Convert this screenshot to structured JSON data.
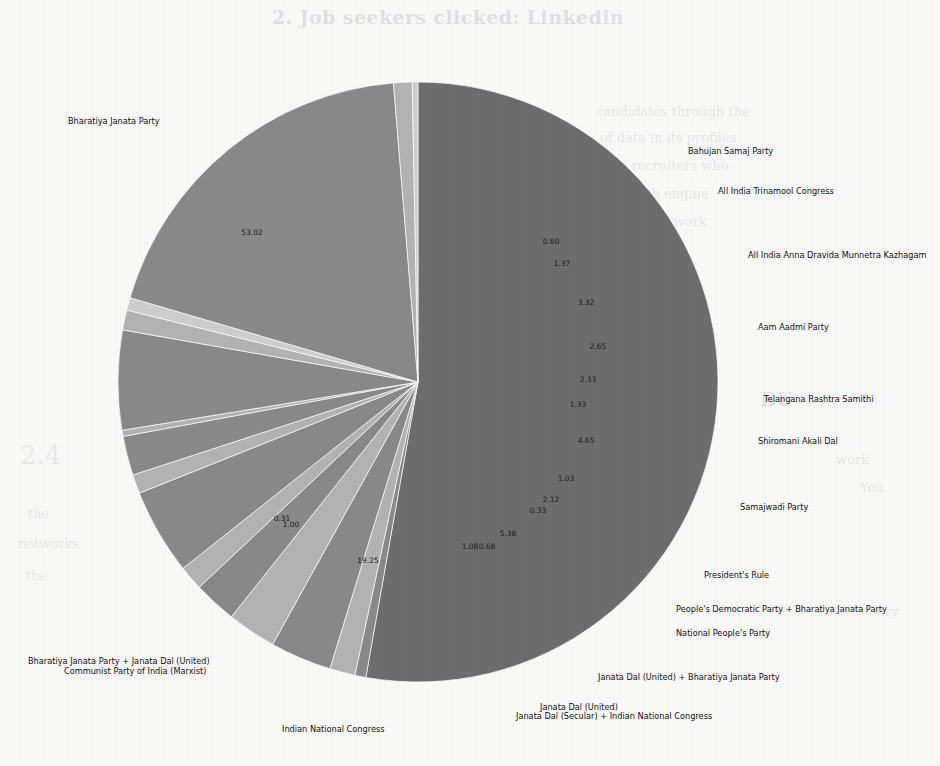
{
  "page": {
    "background_color": "#fbfbfa",
    "bleed_through_texts": [
      {
        "text": "2. Job seekers clicked: Linkedin",
        "x": 272,
        "y": 6,
        "style": "heading"
      },
      {
        "text": "candidates through the",
        "x": 596,
        "y": 104,
        "style": "body"
      },
      {
        "text": "of data in its profiles",
        "x": 600,
        "y": 130,
        "style": "body"
      },
      {
        "text": "the recruiters who",
        "x": 606,
        "y": 158,
        "style": "body"
      },
      {
        "text": "a search engine",
        "x": 604,
        "y": 186,
        "style": "body"
      },
      {
        "text": "of the network",
        "x": 610,
        "y": 214,
        "style": "body"
      },
      {
        "text": "BU",
        "x": 760,
        "y": 388,
        "style": "heading"
      },
      {
        "text": "2.4",
        "x": 20,
        "y": 440,
        "style": "big"
      },
      {
        "text": "work",
        "x": 836,
        "y": 452,
        "style": "body"
      },
      {
        "text": "You",
        "x": 860,
        "y": 480,
        "style": "body"
      },
      {
        "text": "the",
        "x": 28,
        "y": 506,
        "style": "body"
      },
      {
        "text": "networks",
        "x": 18,
        "y": 536,
        "style": "body"
      },
      {
        "text": "the",
        "x": 26,
        "y": 568,
        "style": "body"
      },
      {
        "text": "try",
        "x": 880,
        "y": 604,
        "style": "body"
      },
      {
        "text": "GETS",
        "x": 560,
        "y": 490,
        "style": "big"
      },
      {
        "text": "unlikely",
        "x": 380,
        "y": 520,
        "style": "big"
      }
    ]
  },
  "chart_data": {
    "type": "pie",
    "title": "",
    "units": "percent",
    "label_format": "two-decimal percentage",
    "start_angle_deg": 90,
    "direction": "clockwise",
    "center": {
      "x": 418,
      "y": 382
    },
    "radius": 300,
    "colors": {
      "dark": "#6e6e6e",
      "mid": "#8a8a8a",
      "light": "#b4b4b4",
      "pale": "#cfcfcf"
    },
    "categories": [
      "Bharatiya Janata Party",
      "Bahujan Samaj Party",
      "All India Trinamool Congress",
      "All India Anna Dravida Munnetra Kazhagam",
      "Aam Aadmi Party",
      "Telangana Rashtra Samithi",
      "Shiromani Akali Dal",
      "Samajwadi Party",
      "President's Rule",
      "People's Democratic Party + Bharatiya Janata Party",
      "National People's Party",
      "Janata Dal (United) + Bharatiya Janata Party",
      "Janata Dal (United)",
      "Janata Dal (Secular) + Indian National Congress",
      "Indian National Congress",
      "Communist Party of India (Marxist)",
      "Bharatiya Janata Party + Janata Dal (United)"
    ],
    "values": [
      53.02,
      0.6,
      1.37,
      3.32,
      2.65,
      2.33,
      1.33,
      4.65,
      1.03,
      2.12,
      0.33,
      5.38,
      1.08,
      0.68,
      19.25,
      1.0,
      0.31
    ],
    "value_labels": [
      "53.02",
      "0.60",
      "1.37",
      "3.32",
      "2.65",
      "2.33",
      "1.33",
      "4.65",
      "1.03",
      "2.12",
      "0.33",
      "5.38",
      "1.08",
      "0.68",
      "19.25",
      "1.00",
      "0.31"
    ],
    "slice_colors": [
      "dark",
      "mid",
      "light",
      "mid",
      "light",
      "mid",
      "light",
      "mid",
      "light",
      "mid",
      "light",
      "mid",
      "light",
      "pale",
      "mid",
      "light",
      "pale"
    ],
    "legend_position": "outside-labels",
    "grid": false
  },
  "labels": [
    {
      "name": "bharatiya-janata-party",
      "text": "Bharatiya Janata Party",
      "x": 68,
      "y": 116,
      "align": "left",
      "width": 150
    },
    {
      "name": "bahujan-samaj-party",
      "text": "Bahujan Samaj Party",
      "x": 688,
      "y": 146,
      "align": "right",
      "width": 200
    },
    {
      "name": "all-india-trinamool-congress",
      "text": "All India Trinamool Congress",
      "x": 718,
      "y": 186,
      "align": "right",
      "width": 220
    },
    {
      "name": "all-india-anna-dravida-munnetra-kazhagam",
      "text": "All India Anna Dravida Munnetra Kazhagam",
      "x": 748,
      "y": 250,
      "align": "right",
      "width": 240
    },
    {
      "name": "aam-aadmi-party",
      "text": "Aam Aadmi Party",
      "x": 758,
      "y": 322,
      "align": "right",
      "width": 200
    },
    {
      "name": "telangana-rashtra-samithi",
      "text": "Telangana Rashtra Samithi",
      "x": 764,
      "y": 394,
      "align": "right",
      "width": 200
    },
    {
      "name": "shiromani-akali-dal",
      "text": "Shiromani Akali Dal",
      "x": 758,
      "y": 436,
      "align": "right",
      "width": 200
    },
    {
      "name": "samajwadi-party",
      "text": "Samajwadi Party",
      "x": 740,
      "y": 502,
      "align": "right",
      "width": 200
    },
    {
      "name": "presidents-rule",
      "text": "President's Rule",
      "x": 704,
      "y": 570,
      "align": "right",
      "width": 200
    },
    {
      "name": "peoples-democratic-party-bjp",
      "text": "People's Democratic Party + Bharatiya Janata Party",
      "x": 676,
      "y": 604,
      "align": "right",
      "width": 270
    },
    {
      "name": "national-peoples-party",
      "text": "National People's Party",
      "x": 676,
      "y": 628,
      "align": "right",
      "width": 200
    },
    {
      "name": "janata-dal-united-bjp",
      "text": "Janata Dal (United) + Bharatiya Janata Party",
      "x": 598,
      "y": 672,
      "align": "right",
      "width": 260
    },
    {
      "name": "janata-dal-united",
      "text": "Janata Dal (United)",
      "x": 540,
      "y": 702,
      "align": "center",
      "width": 220
    },
    {
      "name": "janata-dal-secular-inc",
      "text": "Janata Dal (Secular) + Indian National Congress",
      "x": 516,
      "y": 711,
      "align": "center",
      "width": 260
    },
    {
      "name": "indian-national-congress",
      "text": "Indian National Congress",
      "x": 282,
      "y": 724,
      "align": "left",
      "width": 180
    },
    {
      "name": "bharatiya-janata-party-jdu",
      "text": "Bharatiya Janata Party + Janata Dal (United)",
      "x": 28,
      "y": 656,
      "align": "left",
      "width": 260
    },
    {
      "name": "communist-party-of-india-marxist",
      "text": "Communist Party of India (Marxist)",
      "x": 64,
      "y": 666,
      "align": "left",
      "width": 240
    }
  ],
  "value_label_positions": [
    {
      "text": "53.02",
      "x": 252,
      "y": 235
    },
    {
      "text": "0.60",
      "x": 551,
      "y": 244
    },
    {
      "text": "1.37",
      "x": 562,
      "y": 266
    },
    {
      "text": "3.32",
      "x": 586,
      "y": 305
    },
    {
      "text": "2.65",
      "x": 598,
      "y": 349
    },
    {
      "text": "2.33",
      "x": 588,
      "y": 382
    },
    {
      "text": "1.33",
      "x": 578,
      "y": 407
    },
    {
      "text": "4.65",
      "x": 586,
      "y": 443
    },
    {
      "text": "1.03",
      "x": 566,
      "y": 481
    },
    {
      "text": "2.12",
      "x": 551,
      "y": 502
    },
    {
      "text": "0.33",
      "x": 538,
      "y": 513
    },
    {
      "text": "5.38",
      "x": 508,
      "y": 536
    },
    {
      "text": "1.08",
      "x": 470,
      "y": 549
    },
    {
      "text": "0.68",
      "x": 487,
      "y": 549
    },
    {
      "text": "19.25",
      "x": 368,
      "y": 563
    },
    {
      "text": "1.00",
      "x": 291,
      "y": 527
    },
    {
      "text": "0.31",
      "x": 282,
      "y": 521
    }
  ]
}
